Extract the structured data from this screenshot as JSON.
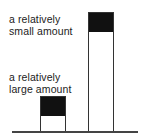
{
  "labels": {
    "small": {
      "line1": "a relatively",
      "line2": "small amount"
    },
    "large": {
      "line1": "a relatively",
      "line2": "large amount"
    }
  },
  "bars": [
    {
      "name": "short-bar",
      "left": 40,
      "width": 25,
      "top": 96,
      "fill_height": 19
    },
    {
      "name": "tall-bar",
      "left": 88,
      "width": 25,
      "top": 12,
      "fill_height": 19
    }
  ],
  "baseline": {
    "y": 131,
    "x1": 12,
    "x2": 138
  },
  "colors": {
    "fill": "#111111",
    "outline": "#333333"
  }
}
